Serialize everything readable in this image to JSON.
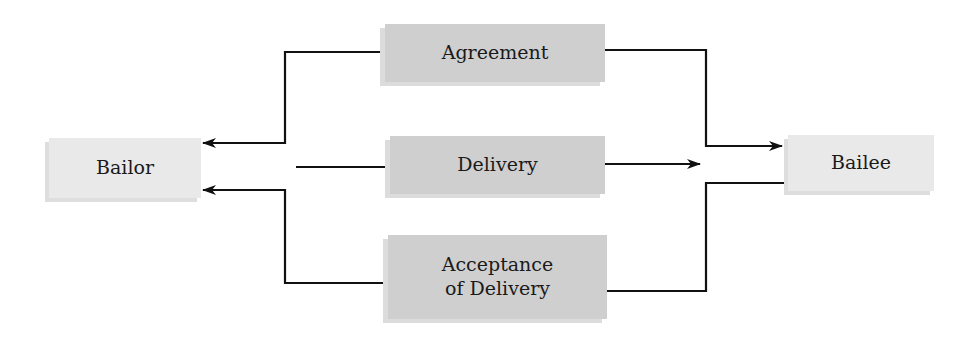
{
  "diagram": {
    "parties": {
      "left": {
        "label": "Bailor"
      },
      "right": {
        "label": "Bailee"
      }
    },
    "elements": [
      {
        "label": "Agreement",
        "direction": "both"
      },
      {
        "label": "Delivery",
        "direction": "to-bailee"
      },
      {
        "label_line1": "Acceptance",
        "label_line2": "of Delivery",
        "direction": "to-bailor"
      }
    ],
    "colors": {
      "middle_box": "#cfcfcf",
      "party_box": "#e9e9e9",
      "line": "#111111"
    }
  }
}
